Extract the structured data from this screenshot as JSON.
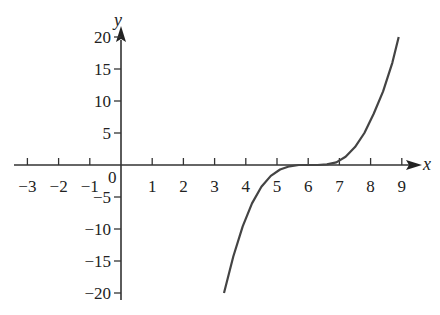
{
  "chart_data": {
    "type": "line",
    "title": "",
    "xlabel": "x",
    "ylabel": "y",
    "origin_label": "0",
    "xlim": [
      -3.3,
      9.5
    ],
    "ylim": [
      -22,
      21
    ],
    "x_ticks": [
      -3,
      -2,
      -1,
      1,
      2,
      3,
      4,
      5,
      6,
      7,
      8,
      9
    ],
    "x_tick_labels": [
      "−3",
      "−2",
      "−1",
      "1",
      "2",
      "3",
      "4",
      "5",
      "6",
      "7",
      "8",
      "9"
    ],
    "y_ticks": [
      20,
      15,
      10,
      5,
      -5,
      -10,
      -15,
      -20
    ],
    "y_tick_labels": [
      "20",
      "15",
      "10",
      "5",
      "−5",
      "−10",
      "−15",
      "−20"
    ],
    "grid": false,
    "series": [
      {
        "name": "curve",
        "color": "#444444",
        "x": [
          3.3,
          3.6,
          3.9,
          4.2,
          4.5,
          4.8,
          5.1,
          5.4,
          5.7,
          6.0,
          6.3,
          6.6,
          6.9,
          7.2,
          7.5,
          7.8,
          8.1,
          8.4,
          8.7,
          8.9
        ],
        "y": [
          -20,
          -14.3,
          -9.6,
          -6.0,
          -3.4,
          -1.7,
          -0.7,
          -0.2,
          0,
          0,
          0,
          0.1,
          0.4,
          1.3,
          2.8,
          5.0,
          8.0,
          11.5,
          16.0,
          20
        ]
      }
    ]
  }
}
